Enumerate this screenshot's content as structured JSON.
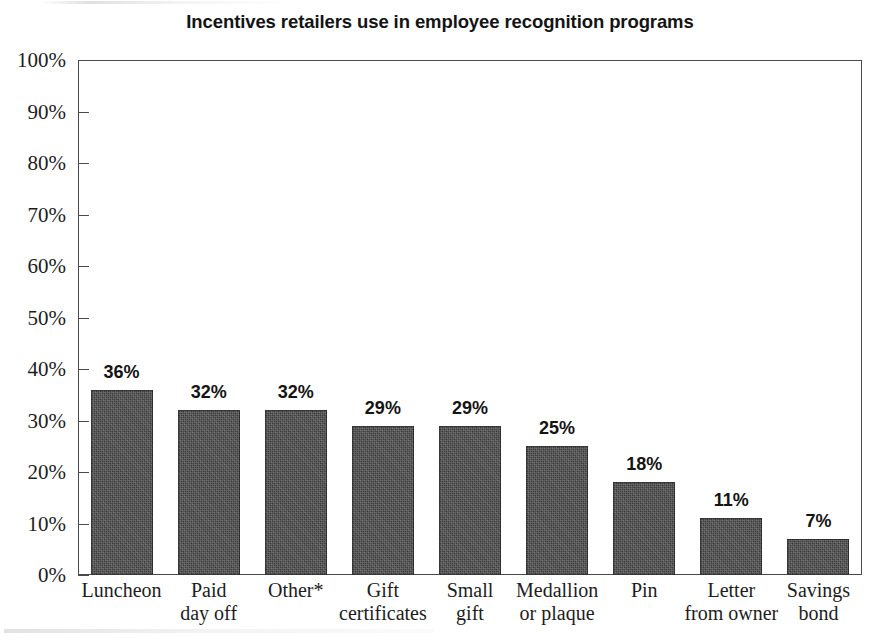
{
  "chart_data": {
    "type": "bar",
    "title": "Incentives retailers use in employee recognition programs",
    "xlabel": "",
    "ylabel": "",
    "ylim": [
      0,
      100
    ],
    "grid": false,
    "legend": "none",
    "value_suffix": "%",
    "categories": [
      "Luncheon",
      "Paid day off",
      "Other*",
      "Gift certificates",
      "Small gift",
      "Medallion or plaque",
      "Pin",
      "Letter from owner",
      "Savings bond"
    ],
    "category_lines": [
      [
        "Luncheon",
        ""
      ],
      [
        "Paid",
        "day off"
      ],
      [
        "Other*",
        ""
      ],
      [
        "Gift",
        "certificates"
      ],
      [
        "Small",
        "gift"
      ],
      [
        "Medallion",
        "or plaque"
      ],
      [
        "Pin",
        ""
      ],
      [
        "Letter",
        "from owner"
      ],
      [
        "Savings",
        "bond"
      ]
    ],
    "values": [
      36,
      32,
      32,
      29,
      29,
      25,
      18,
      11,
      7
    ],
    "value_labels": [
      "36%",
      "32%",
      "32%",
      "29%",
      "29%",
      "25%",
      "18%",
      "11%",
      "7%"
    ],
    "y_ticks": [
      0,
      10,
      20,
      30,
      40,
      50,
      60,
      70,
      80,
      90,
      100
    ],
    "y_tick_labels": [
      "0%",
      "10%",
      "20%",
      "30%",
      "40%",
      "50%",
      "60%",
      "70%",
      "80%",
      "90%",
      "100%"
    ],
    "bar_color": "#3b3b3b",
    "axis_color": "#4a4a4a",
    "background_color": "#ffffff",
    "text_color": "#1a1a1a"
  }
}
